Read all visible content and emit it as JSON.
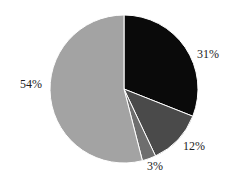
{
  "chart_data": {
    "type": "pie",
    "title": "",
    "categories": [
      "A",
      "B",
      "C",
      "D"
    ],
    "values": [
      31,
      12,
      3,
      54
    ],
    "labels": [
      "31%",
      "12%",
      "3%",
      "54%"
    ],
    "colors": [
      "#0a0a0a",
      "#4a4a4a",
      "#6e6e6e",
      "#a3a3a3"
    ],
    "start_angle_deg": 90,
    "direction": "clockwise",
    "legend": "none"
  }
}
